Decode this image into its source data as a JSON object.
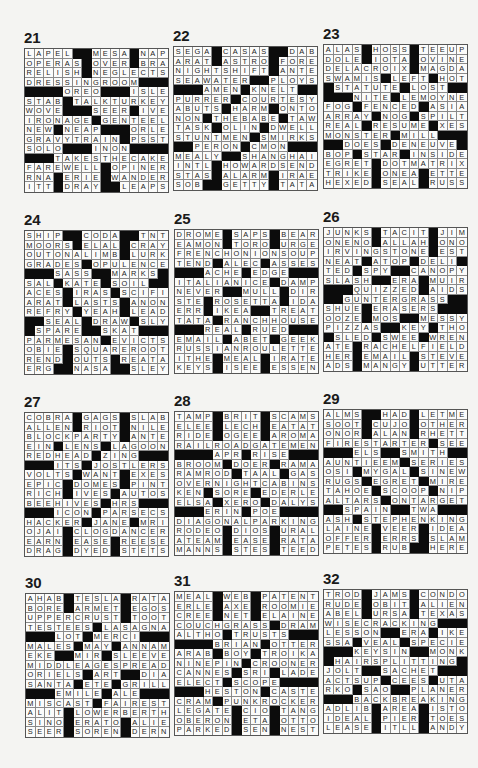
{
  "page": {
    "background": "#f4f4f2",
    "black_cell_color": "#0c0c0c"
  },
  "puzzles": [
    {
      "number": "21",
      "rows": [
        "LAPEL##MESA#NAP",
        "OPERAS#OVER#BRA",
        "RELISH#NEGLECTS",
        "DRESSINGROOM###",
        "####OREO###ISLE",
        "STAB#TALKTURKEY",
        "WOVE###SEER#IVE",
        "IRONAGE#GENTEEL",
        "NEW#NEAP###ORLE",
        "GRAVYTRAIN#PSST",
        "SOLO###INON####",
        "###TAKESTHECAKE",
        "FAREWELL#OPINER",
        "RNA#ERIE#WANDER",
        "ITT#DRAY##LEAPS"
      ]
    },
    {
      "number": "22",
      "rows": [
        "SEGA#CASAS##DAB",
        "ARAT#ASTRO#FORE",
        "NIGHTSHIFT#ANTE",
        "SEAWATER##PLOYS",
        "###AMEN#KNELT##",
        "PURRER#COURTESY",
        "ABUTS#HARM#ONTO",
        "NON#THEBABE#TAW",
        "TASK#OLIN#DWELL",
        "STUNTMEN#SMIRKS",
        "##PERON#CMON###",
        "MEALY##SHANGHAI",
        "INTL#HOWARDSEND",
        "STAS#ALARM#IRAE",
        "SOB##GETTY#TATA"
      ]
    },
    {
      "number": "23",
      "rows": [
        "ALAS#HOSS#TEEUP",
        "DOLE#IOTA#OVINE",
        "DELACROIX#MAGDA",
        "SWAMIS#LEFT#HOT",
        "#STATUTE#LOST##",
        "###NITE#LEMOYNE",
        "FOG#FENCED#ASIA",
        "ARRAY#NOG#SPILT",
        "REAL#RESUME#XES",
        "MONSTER#MILL###",
        "##DOES#DENEUVE#",
        "BOP#STAR#INSIDE",
        "EGRET#DOTMATRIX",
        "TRIKE#ONEA#ETTE",
        "HEXED#SEAL#RUSS"
      ]
    },
    {
      "number": "24",
      "rows": [
        "SHIP##CODA##TNT",
        "MOORS#ELAL#CRAY",
        "OUTONALIMB#LURK",
        "GRADES#OPULENCE",
        "###SASS##MARKS#",
        "SAL#KATE#SOIL##",
        "ACES#IRAS#SCIFI",
        "ARAT#LASTS#ANON",
        "REFRY#YEAH#LEAD",
        "##SEAL#DRAW#SLY",
        "#SPARE##SKAT###",
        "PARMESAN#EVICTS",
        "OBIE#SQUAREROOT",
        "REND#OUTS#REATA",
        "ERG##NASA##SLEY"
      ]
    },
    {
      "number": "25",
      "rows": [
        "DROME#SAPS#BEAR",
        "EAMON#TORO#URGE",
        "FRENCHONIONSOUP",
        "TEND#ALEC#ASSES",
        "###ACHE#EDGE###",
        "ITALIANICE#DAMP",
        "NEVER##MULL#DIR",
        "STE#ROSETTA#IDA",
        "ERR#IKEA##TREAT",
        "TATA#RANCHHOUSE",
        "###REAL#RUED###",
        "EMAIL#ABET#GEEK",
        "RUSSIANROULETTE",
        "ITHE#MEAL#IRATE",
        "KEYS#ISEE#ESSEN"
      ]
    },
    {
      "number": "26",
      "rows": [
        "JUNKS#TACIT#JIM",
        "ONENO#ALLAH#ONO",
        "IRVINGSTONE#EST",
        "NEAT#ATOP#DELI#",
        "TED#SPY##CANOPY",
        "SLASH##ERA#MUIR",
        "###QUIZZED#AIDS",
        "##GUNTERGRASS##",
        "SHUE#ERASERS###",
        "OOZE#MOS##MESSY",
        "PIZZAS##KEY#THO",
        "#SLED#SWEE#WREN",
        "ATE#RACHELFIELD",
        "HER#EMAIL#STEVE",
        "ADS#MANGY#UTTER"
      ]
    },
    {
      "number": "27",
      "rows": [
        "COBRA#GAGS#SLAB",
        "ALLEN#RIOT#NILE",
        "BLOCKPARTY#ANTE",
        "EIN#LENS#LAGOON",
        "REDHEAD#ZING###",
        "###ITS#JOSTLERS",
        "VOLTS#WANT#EXES",
        "EPIC#DOMES#PINT",
        "RICH#IVES#AUTOS",
        "BEEHIVES#HRS###",
        "###ICON#PARSECS",
        "HACKER#JANE#MRI",
        "OJAI#CLOGDANCER",
        "EARN#EASE#REESE",
        "DRAG#DYED#STETS"
      ]
    },
    {
      "number": "28",
      "rows": [
        "TAMP#BRIT#SCAMS",
        "ELEE#LECH#EATAT",
        "RIDE#OGEE#AROMA",
        "RAILROADGATEMEN",
        "####APR#RISE###",
        "BROOM#DOER#RAMA",
        "RAMROD#TAAL#GAS",
        "OVERNIGHTCABINS",
        "KEN#SORE#EDERLE",
        "ELSA#XERO#DALYS",
        "###ERIN#POE####",
        "DIAGONALPARKING",
        "RODEO#DIOS#URAL",
        "ATEAM#EASE#RATA",
        "MANNS#STES#TEED"
      ]
    },
    {
      "number": "29",
      "rows": [
        "ALMS##HAD#LETME",
        "SOOT#CUJO#OTHER",
        "ONOR#ALAN#RHETT",
        "FIRESTARTER#SEE",
        "###ELS##SMITH##",
        "AUNTIEEM#SERIES",
        "OSI#MYGAL#SINEW",
        "RUGS#EGRET#MIRE",
        "TAHOE#SCOOP#NIP",
        "ALTARS#ONTARGET",
        "##SPAIN##TWA###",
        "ASH#STEPHENKING",
        "LAINE#VEER#IDEA",
        "OFFER#ERRS#SLAM",
        "PETES#RUB##HERE"
      ]
    },
    {
      "number": "30",
      "rows": [
        "AHAB#TESLA#RATA",
        "BORE#ARMET#EGOS",
        "UPPERCRUST#TOOT",
        "TESTEES#LASAGNA",
        "###LOT#MERCI###",
        "MALES#MAY#ANNAM",
        "EKE##MIR#SLEEVE",
        "MIDDLEAGESPREAD",
        "ORIELS#ART##DIA",
        "SANTA#ETE#GRILL",
        "###EMILE#ALE###",
        "MISCAST#FAIREST",
        "ALIT#LOWERBERTH",
        "SINO#ERATO#ALIE",
        "SEER#SOREN#DERN"
      ]
    },
    {
      "number": "31",
      "rows": [
        "MEAL#WEB#PATENT",
        "ERLE#AXE#ROOMIE",
        "CREE#NET#ELAINE",
        "COUCHGRASS#DRAM",
        "ALTHO#TRUSTS###",
        "####BRIAN#OTTER",
        "ARAB#BOY#TROIKA",
        "NINEPIN#CROONER",
        "CANNES#SRI#LADE",
        "ELECT#SCOPE####",
        "###HESTON#CASTE",
        "CRAM#PUNKROCKER",
        "LEGATE#CIO#TANG",
        "OBERON#ETA#OTTO",
        "PARKED#SEN#NEST"
      ]
    },
    {
      "number": "32",
      "rows": [
        "TROD#JAMS#CONDO",
        "RUDE#OBIT#ALIEN",
        "ABEL#URSA#TEXAS",
        "WISECRACKING###",
        "LESSON##ERA#IKE",
        "SSA#VEAL#SPECIE",
        "###KEYSIN##MONK",
        "#HAIRSPLITTING#",
        "JOLT##SACHET###",
        "ACTSUP#CEES#UTA",
        "RKO#SAO##PLANER",
        "###BACKBREAKING",
        "ADLIB#AREA#ISTO",
        "IDEAL#PIER#TOES",
        "LEASE#ITLL#ANDY"
      ]
    }
  ]
}
